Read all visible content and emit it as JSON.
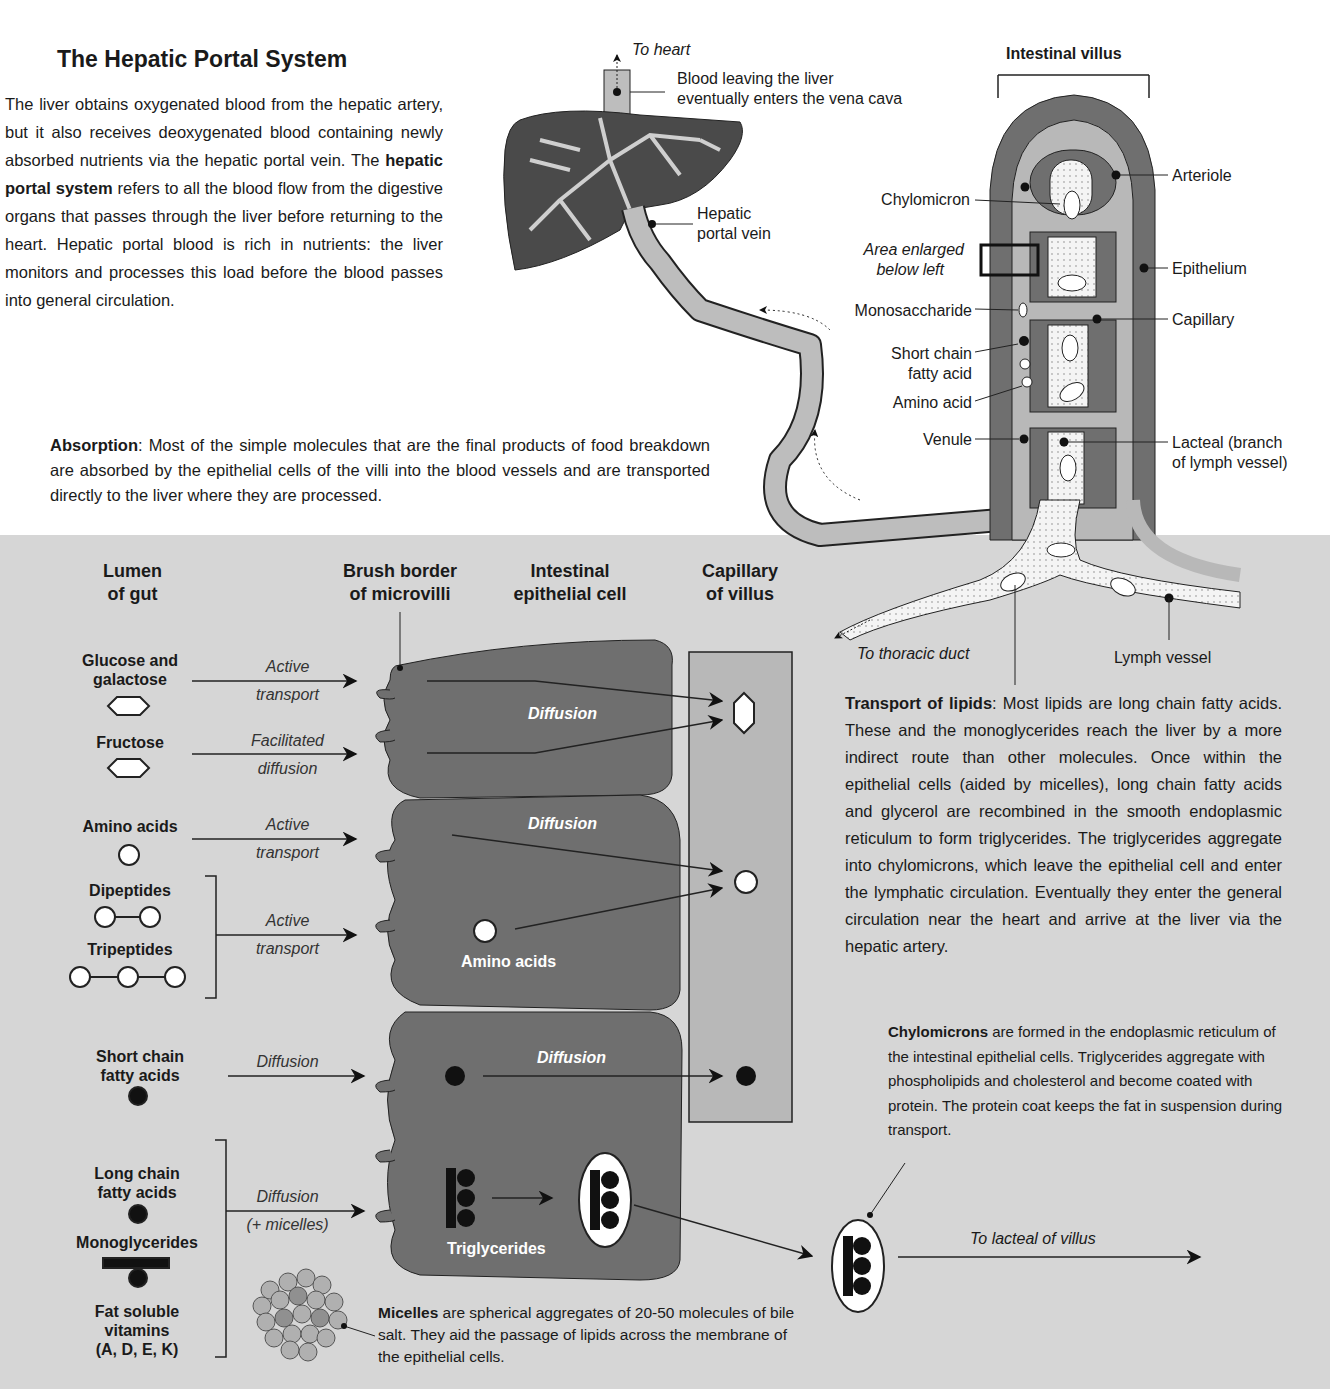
{
  "intro": {
    "title": "The Hepatic Portal System",
    "paragraph_part1": "The liver obtains oxygenated blood from the hepatic artery, but it also receives deoxygenated blood containing newly absorbed nutrients via the hepatic portal vein. The ",
    "paragraph_bold": "hepatic portal system",
    "paragraph_part2": " refers to all the blood flow from the digestive organs that passes through the liver before returning to the heart. Hepatic portal blood is rich in nutrients: the liver monitors and processes this load before the blood passes into general circulation."
  },
  "liver": {
    "to_heart": "To heart",
    "vena_cava_label_line1": "Blood leaving the liver",
    "vena_cava_label_line2": "eventually enters the vena cava",
    "portal_vein_line1": "Hepatic",
    "portal_vein_line2": "portal vein"
  },
  "villus": {
    "title": "Intestinal villus",
    "labels_left": {
      "chylomicron": "Chylomicron",
      "area_enlarged_line1": "Area enlarged",
      "area_enlarged_line2": "below left",
      "monosaccharide": "Monosaccharide",
      "short_chain_line1": "Short chain",
      "short_chain_line2": "fatty acid",
      "amino_acid": "Amino acid",
      "venule": "Venule"
    },
    "labels_right": {
      "arteriole": "Arteriole",
      "epithelium": "Epithelium",
      "capillary": "Capillary",
      "lacteal_line1": "Lacteal (branch",
      "lacteal_line2": "of lymph vessel)"
    },
    "to_thoracic_duct": "To thoracic duct",
    "lymph_vessel": "Lymph vessel"
  },
  "absorption": {
    "bold": "Absorption",
    "text": ": Most of the simple molecules that are the final products of food breakdown are absorbed by the epithelial cells of the villi into the blood vessels and are transported directly to the liver where they are processed."
  },
  "enlarged": {
    "headers": {
      "lumen_line1": "Lumen",
      "lumen_line2": "of gut",
      "brush_line1": "Brush border",
      "brush_line2": "of microvilli",
      "cell_line1": "Intestinal",
      "cell_line2": "epithelial cell",
      "capillary_line1": "Capillary",
      "capillary_line2": "of villus"
    },
    "molecules": {
      "glucose_line1": "Glucose and",
      "glucose_line2": "galactose",
      "fructose": "Fructose",
      "amino_acids": "Amino acids",
      "dipeptides": "Dipeptides",
      "tripeptides": "Tripeptides",
      "scfa_line1": "Short chain",
      "scfa_line2": "fatty acids",
      "lcfa_line1": "Long chain",
      "lcfa_line2": "fatty acids",
      "monoglycerides": "Monoglycerides",
      "vitamins_line1": "Fat soluble",
      "vitamins_line2": "vitamins",
      "vitamins_line3": "(A, D, E, K)"
    },
    "processes": {
      "active": "Active",
      "transport": "transport",
      "facilitated": "Facilitated",
      "diffusion_lc": "diffusion",
      "diffusion": "Diffusion",
      "plus_micelles": "(+ micelles)"
    },
    "cell_labels": {
      "diffusion": "Diffusion",
      "amino_acids": "Amino acids",
      "triglycerides": "Triglycerides"
    },
    "to_lacteal": "To lacteal of villus"
  },
  "lipids": {
    "bold": "Transport of lipids",
    "text": ": Most lipids are long chain fatty acids. These and the monoglycerides reach the liver by a more indirect route than other molecules. Once within the epithelial cells (aided by micelles), long chain fatty acids and glycerol are recombined in the smooth endoplasmic reticulum to form triglycerides. The triglycerides aggregate into chylomicrons, which leave the epithelial cell and enter the lymphatic circulation. Eventually they enter the general circulation near the heart and arrive at the liver via the hepatic artery."
  },
  "chylomicrons": {
    "bold": "Chylomicrons",
    "text": " are formed in the endoplasmic reticulum of the intestinal epithelial cells. Triglycerides aggregate with phospholipids and cholesterol and become coated with protein. The protein coat keeps the fat in suspension during transport."
  },
  "micelles": {
    "bold": "Micelles",
    "text": " are spherical aggregates of 20-50 molecules of bile salt. They aid the passage of lipids across the membrane of the epithelial cells."
  },
  "colors": {
    "panel_bg": "#d6d6d6",
    "dark_tissue": "#6f6f6f",
    "light_vessel": "#b8b8b8",
    "liver_dark": "#4a4a4a"
  }
}
